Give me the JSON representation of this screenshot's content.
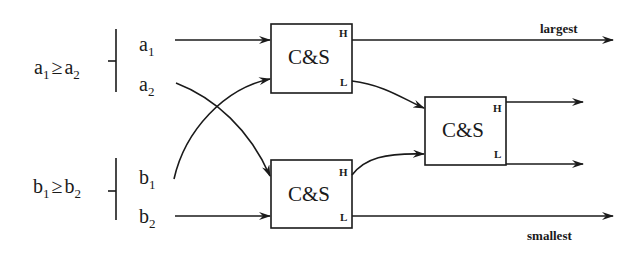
{
  "diagram": {
    "conditions": {
      "a": {
        "left": "a",
        "left_sub": "1",
        "op": "≥",
        "right": "a",
        "right_sub": "2"
      },
      "b": {
        "left": "b",
        "left_sub": "1",
        "op": "≥",
        "right": "b",
        "right_sub": "2"
      }
    },
    "inputs": [
      {
        "name": "a",
        "sub": "1"
      },
      {
        "name": "a",
        "sub": "2"
      },
      {
        "name": "b",
        "sub": "1"
      },
      {
        "name": "b",
        "sub": "2"
      }
    ],
    "boxes": [
      {
        "label": "C&S",
        "high": "H",
        "low": "L"
      },
      {
        "label": "C&S",
        "high": "H",
        "low": "L"
      },
      {
        "label": "C&S",
        "high": "H",
        "low": "L"
      }
    ],
    "outputs": {
      "top": "largest",
      "bottom": "smallest"
    },
    "colors": {
      "line": "#1a1a1a",
      "background": "#ffffff"
    }
  }
}
